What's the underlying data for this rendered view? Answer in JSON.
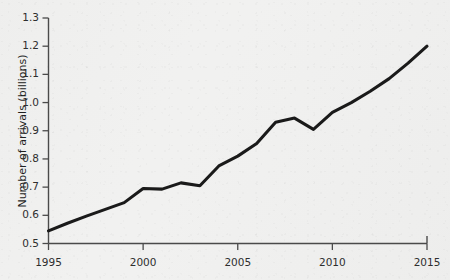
{
  "chart_data": {
    "type": "line",
    "title": "",
    "xlabel": "",
    "ylabel": "Number of arrivals (billions)",
    "xlim": [
      1995,
      2015
    ],
    "ylim": [
      0.5,
      1.3
    ],
    "grid": false,
    "legend": "none",
    "x_tick_labels": [
      "1995",
      "2000",
      "2005",
      "2010",
      "2015"
    ],
    "x_ticks": [
      1995,
      2000,
      2005,
      2010,
      2015
    ],
    "y_tick_labels": [
      "0.5",
      "0.6",
      "0.7",
      "0.8",
      "0.9",
      "1.0",
      "1.1",
      "1.2",
      "1.3"
    ],
    "y_ticks": [
      0.5,
      0.6,
      0.7,
      0.8,
      0.9,
      1.0,
      1.1,
      1.2,
      1.3
    ],
    "x": [
      1995,
      1996,
      1997,
      1998,
      1999,
      2000,
      2001,
      2002,
      2003,
      2004,
      2005,
      2006,
      2007,
      2008,
      2009,
      2010,
      2011,
      2012,
      2013,
      2014,
      2015
    ],
    "series": [
      {
        "name": "International tourist arrivals",
        "color": "#1a1a1a",
        "values": [
          0.545,
          0.572,
          0.597,
          0.621,
          0.645,
          0.695,
          0.693,
          0.715,
          0.705,
          0.775,
          0.81,
          0.855,
          0.93,
          0.945,
          0.905,
          0.965,
          1.0,
          1.04,
          1.085,
          1.14,
          1.2
        ]
      }
    ]
  },
  "axes": {
    "y_axis_title": "Number of arrivals (billions)"
  }
}
